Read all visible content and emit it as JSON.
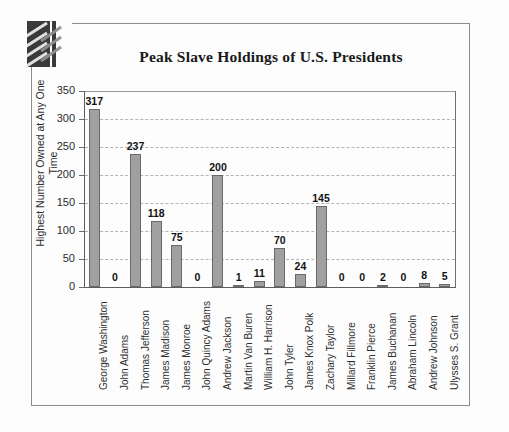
{
  "document": {
    "logo_icon": "diagonal-slashes-logo"
  },
  "chart_data": {
    "type": "bar",
    "title": "Peak Slave Holdings of U.S. Presidents",
    "xlabel": "",
    "ylabel": "Highest Number Owned at Any One Time",
    "ylim": [
      0,
      350
    ],
    "yticks": [
      0,
      50,
      100,
      150,
      200,
      250,
      300,
      350
    ],
    "ytick_labels": [
      "0",
      "50",
      "100",
      "150",
      "200",
      "250",
      "300",
      "350"
    ],
    "grid": true,
    "legend": "none",
    "bar_color": "#a0a0a0",
    "bar_border_color": "#6a6a6a",
    "categories": [
      "George Washington",
      "John Adams",
      "Thomas Jefferson",
      "James Madison",
      "James Monroe",
      "John Quincy Adams",
      "Andrew Jackson",
      "Martin Van Buren",
      "William H. Harrison",
      "John Tyler",
      "James Knox Polk",
      "Zachary Taylor",
      "Millard Fillmore",
      "Franklin Pierce",
      "James Buchanan",
      "Abraham Lincoln",
      "Andrew Johnson",
      "Ulysses S. Grant"
    ],
    "values": [
      317,
      0,
      237,
      118,
      75,
      0,
      200,
      1,
      11,
      70,
      24,
      145,
      0,
      0,
      2,
      0,
      8,
      5
    ],
    "data_labels": [
      "317",
      "0",
      "237",
      "118",
      "75",
      "0",
      "200",
      "1",
      "11",
      "70",
      "24",
      "145",
      "0",
      "0",
      "2",
      "0",
      "8",
      "5"
    ]
  }
}
